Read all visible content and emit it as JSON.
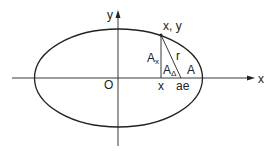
{
  "diagram": {
    "colors": {
      "stroke": "#222222",
      "background": "#ffffff"
    },
    "axes": {
      "x_label": "x",
      "y_label": "y"
    },
    "labels": {
      "origin": "O",
      "point": "x, y",
      "foot": "x",
      "focus": "ae",
      "radius": "r",
      "area_x_main": "A",
      "area_x_sub": "x",
      "area_delta_main": "A",
      "area_delta_sub": "Δ",
      "area": "A"
    }
  }
}
